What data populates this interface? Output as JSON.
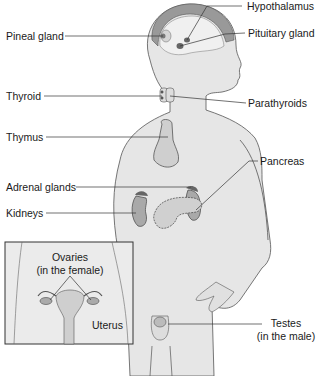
{
  "diagram": {
    "labels": {
      "hypothalamus": "Hypothalamus",
      "pineal_gland": "Pineal gland",
      "pituitary_gland": "Pituitary gland",
      "thyroid": "Thyroid",
      "parathyroids": "Parathyroids",
      "thymus": "Thymus",
      "pancreas": "Pancreas",
      "adrenal_glands": "Adrenal glands",
      "kidneys": "Kidneys",
      "ovaries_line1": "Ovaries",
      "ovaries_line2": "(in the female)",
      "uterus": "Uterus",
      "testes_line1": "Testes",
      "testes_line2": "(in the male)"
    },
    "colors": {
      "skin": "#e4e4e4",
      "outline": "#555555",
      "gland": "#9a9a9a",
      "leader": "#333333"
    }
  }
}
